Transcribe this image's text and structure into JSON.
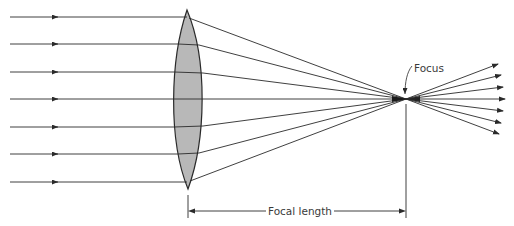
{
  "diagram": {
    "labels": {
      "focus": "Focus",
      "focal_length": "Focal length"
    },
    "colors": {
      "ray": "#2a2a2a",
      "lens_fill": "#b8b8b8",
      "lens_stroke": "#2a2a2a",
      "background": "#ffffff"
    },
    "incoming_rays_y": [
      17,
      44,
      72,
      99,
      127,
      154,
      182
    ],
    "outgoing_ray_ends": [
      [
        498,
        64
      ],
      [
        501,
        75
      ],
      [
        503,
        87
      ],
      [
        505,
        99
      ],
      [
        503,
        111
      ],
      [
        501,
        123
      ],
      [
        499,
        134
      ]
    ],
    "focus_point": [
      406,
      99
    ],
    "lens": {
      "top": [
        187,
        10
      ],
      "bottom": [
        188,
        189
      ],
      "left_x": 172,
      "right_x": 204
    }
  }
}
